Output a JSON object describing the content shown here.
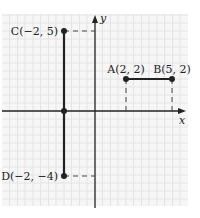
{
  "diagram": {
    "type": "coordinate-plane",
    "axes": {
      "x_label": "x",
      "y_label": "y"
    },
    "points": [
      {
        "id": "A",
        "label": "A(2, 2)",
        "x": 2,
        "y": 2
      },
      {
        "id": "B",
        "label": "B(5, 2)",
        "x": 5,
        "y": 2
      },
      {
        "id": "C",
        "label": "C(−2, 5)",
        "x": -2,
        "y": 5
      },
      {
        "id": "D",
        "label": "D(−2, −4)",
        "x": -2,
        "y": -4
      }
    ],
    "segments": [
      {
        "from": "A",
        "to": "B"
      },
      {
        "from": "C",
        "to": "D"
      }
    ],
    "colors": {
      "grid": "#ececec",
      "background": "#f6f6f6",
      "line": "#222222"
    }
  }
}
